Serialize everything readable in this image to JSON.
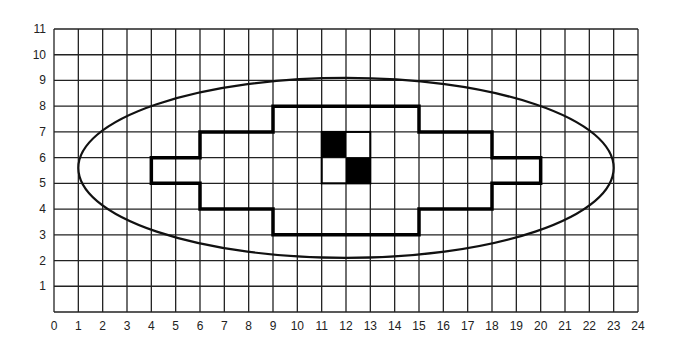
{
  "diagram": {
    "type": "grid-diagram",
    "grid": {
      "x_min": 0,
      "x_max": 24,
      "y_min": 0,
      "y_max": 11,
      "x_ticks": [
        "0",
        "1",
        "2",
        "3",
        "4",
        "5",
        "6",
        "7",
        "8",
        "9",
        "10",
        "11",
        "12",
        "13",
        "14",
        "15",
        "16",
        "17",
        "18",
        "19",
        "20",
        "21",
        "22",
        "23",
        "24"
      ],
      "y_ticks": [
        "1",
        "2",
        "3",
        "4",
        "5",
        "6",
        "7",
        "8",
        "9",
        "10",
        "11"
      ],
      "line_color": "#222222"
    },
    "ellipse": {
      "cx": 12,
      "cy": 5.6,
      "rx": 11,
      "ry": 3.5,
      "stroke": "#111111"
    },
    "outline_polygon": {
      "points": [
        [
          9,
          8
        ],
        [
          15,
          8
        ],
        [
          15,
          7
        ],
        [
          18,
          7
        ],
        [
          18,
          6
        ],
        [
          20,
          6
        ],
        [
          20,
          5
        ],
        [
          18,
          5
        ],
        [
          18,
          4
        ],
        [
          15,
          4
        ],
        [
          15,
          3
        ],
        [
          9,
          3
        ],
        [
          9,
          4
        ],
        [
          6,
          4
        ],
        [
          6,
          5
        ],
        [
          4,
          5
        ],
        [
          4,
          6
        ],
        [
          6,
          6
        ],
        [
          6,
          7
        ],
        [
          9,
          7
        ]
      ],
      "stroke": "#000000"
    },
    "inner_box": {
      "x": 11,
      "y": 5,
      "w": 2,
      "h": 2
    },
    "filled_cells": [
      {
        "x": 11,
        "y": 6,
        "color": "#000000"
      },
      {
        "x": 12,
        "y": 5,
        "color": "#000000"
      }
    ]
  }
}
